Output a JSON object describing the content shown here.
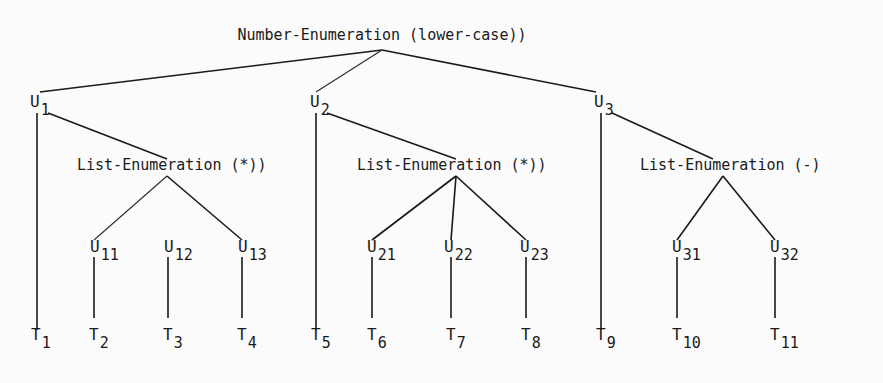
{
  "root": {
    "label": "Number-Enumeration (lower-case))",
    "x": 382,
    "y": 40,
    "apex": [
      382,
      50
    ]
  },
  "level1": [
    {
      "id": "U1",
      "base": "U",
      "sub": "1",
      "x": 30,
      "y": 107,
      "line_x": 37,
      "top_in": [
        40,
        92
      ],
      "link_from": [
        48,
        113
      ]
    },
    {
      "id": "U2",
      "base": "U",
      "sub": "2",
      "x": 310,
      "y": 107,
      "line_x": 316,
      "top_in": [
        316,
        92
      ],
      "link_from": [
        327,
        113
      ]
    },
    {
      "id": "U3",
      "base": "U",
      "sub": "3",
      "x": 594,
      "y": 107,
      "line_x": 601,
      "top_in": [
        596,
        92
      ],
      "link_from": [
        612,
        113
      ]
    }
  ],
  "lists": [
    {
      "label": "List-Enumeration (*))",
      "x": 77,
      "y": 170,
      "apex": [
        167,
        176
      ],
      "link_to": [
        167,
        159
      ]
    },
    {
      "label": "List-Enumeration (*))",
      "x": 357,
      "y": 170,
      "apex": [
        456,
        176
      ],
      "link_to": [
        456,
        159
      ]
    },
    {
      "label": "List-Enumeration (-)",
      "x": 640,
      "y": 170,
      "apex": [
        723,
        176
      ],
      "link_to": [
        713,
        159
      ]
    }
  ],
  "direct_terminals": [
    {
      "base": "T",
      "sub": "1",
      "x": 31,
      "line_x": 37
    },
    {
      "base": "T",
      "sub": "5",
      "x": 311,
      "line_x": 316
    },
    {
      "base": "T",
      "sub": "9",
      "x": 596,
      "line_x": 601
    }
  ],
  "level2": [
    {
      "base": "U",
      "sub": "11",
      "x": 90,
      "line_x": 94,
      "parent": 0,
      "connected": true,
      "term": {
        "base": "T",
        "sub": "2"
      }
    },
    {
      "base": "U",
      "sub": "12",
      "x": 164,
      "line_x": 168,
      "parent": 0,
      "connected": false,
      "term": {
        "base": "T",
        "sub": "3"
      }
    },
    {
      "base": "U",
      "sub": "13",
      "x": 238,
      "line_x": 242,
      "parent": 0,
      "connected": true,
      "term": {
        "base": "T",
        "sub": "4"
      }
    },
    {
      "base": "U",
      "sub": "21",
      "x": 367,
      "line_x": 372,
      "parent": 1,
      "connected": true,
      "term": {
        "base": "T",
        "sub": "6"
      }
    },
    {
      "base": "U",
      "sub": "22",
      "x": 444,
      "line_x": 451,
      "parent": 1,
      "connected": true,
      "term": {
        "base": "T",
        "sub": "7"
      }
    },
    {
      "base": "U",
      "sub": "23",
      "x": 520,
      "line_x": 526,
      "parent": 1,
      "connected": true,
      "term": {
        "base": "T",
        "sub": "8"
      }
    },
    {
      "base": "U",
      "sub": "31",
      "x": 672,
      "line_x": 677,
      "parent": 2,
      "connected": true,
      "term": {
        "base": "T",
        "sub": "10"
      }
    },
    {
      "base": "U",
      "sub": "32",
      "x": 770,
      "line_x": 775,
      "parent": 2,
      "connected": true,
      "term": {
        "base": "T",
        "sub": "11"
      }
    }
  ],
  "layout": {
    "u2_label_y": 252,
    "u2_top": 240,
    "u2_line_top": 257,
    "u2_line_bottom": 318,
    "t_label_y": 340,
    "l1_line_top": 113,
    "l1_line_bottom": 330
  }
}
